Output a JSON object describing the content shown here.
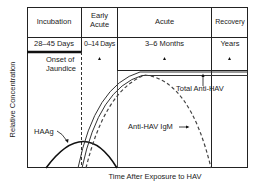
{
  "phases": [
    {
      "name": "Incubation",
      "duration": "28–45 Days",
      "marker": false
    },
    {
      "name": "Early Acute",
      "duration": "0–14 Days",
      "marker": true
    },
    {
      "name": "Acute",
      "duration": "3–6 Months",
      "marker": true
    },
    {
      "name": "Recovery",
      "duration": "Years",
      "marker": true
    }
  ],
  "annotations": {
    "onset": "Onset of Jaundice",
    "total_anti_hav": "Total Anti-HAV",
    "anti_hav_igm": "Anti-HAV IgM",
    "haag": "HAAg"
  },
  "axes": {
    "y_label": "Relative Concentration",
    "x_label": "Time After Exposure to HAV"
  }
}
